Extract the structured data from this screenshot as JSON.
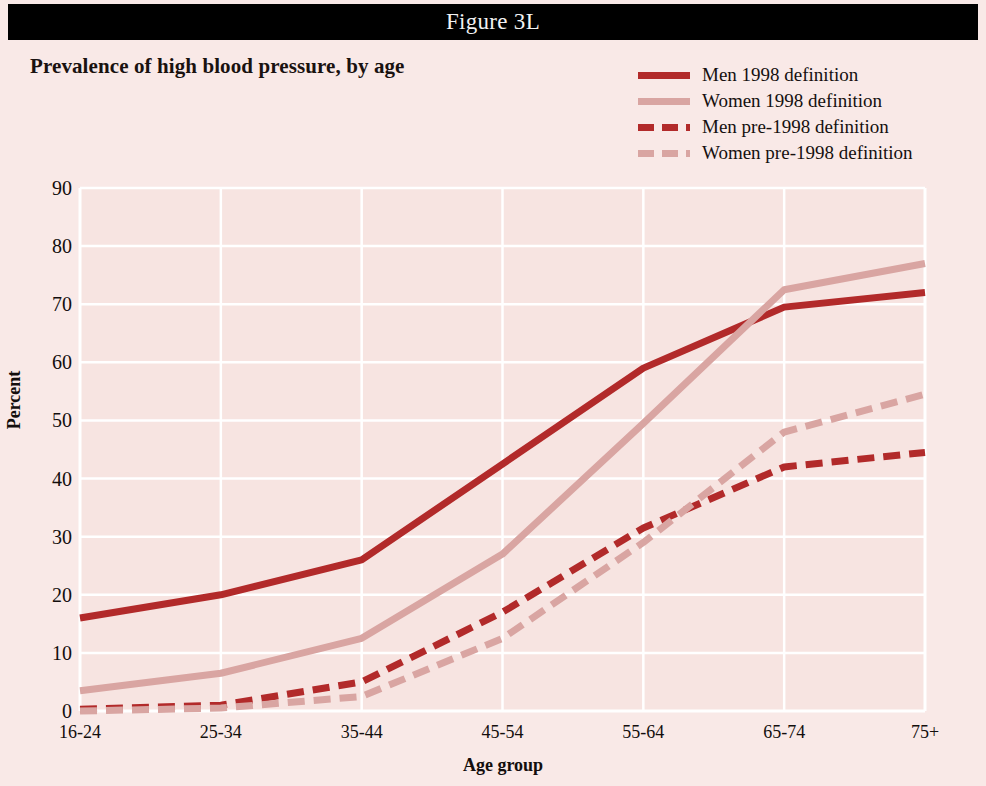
{
  "figure": {
    "label": "Figure 3L"
  },
  "chart_title": "Prevalence of high blood pressure, by age",
  "legend": {
    "items": [
      {
        "label": "Men 1998 definition",
        "color": "#b22a2a",
        "style": "solid"
      },
      {
        "label": "Women 1998 definition",
        "color": "#d9a5a2",
        "style": "solid"
      },
      {
        "label": "Men pre-1998 definition",
        "color": "#b22a2a",
        "style": "dashed"
      },
      {
        "label": "Women pre-1998 definition",
        "color": "#d9a5a2",
        "style": "dashed"
      }
    ]
  },
  "axes": {
    "ylabel": "Percent",
    "xlabel": "Age group",
    "yticks": [
      "0",
      "10",
      "20",
      "30",
      "40",
      "50",
      "60",
      "70",
      "80",
      "90"
    ],
    "xticks": [
      "16-24",
      "25-34",
      "35-44",
      "45-54",
      "55-64",
      "65-74",
      "75+"
    ]
  },
  "colors": {
    "background": "#f9e9e7",
    "plot_background": "#f7e4e1",
    "gridline": "#ffffff",
    "men": "#b22a2a",
    "women": "#d9a5a2",
    "bar_black": "#000000",
    "text": "#130e0d"
  },
  "chart_data": {
    "type": "line",
    "title": "Prevalence of high blood pressure, by age",
    "xlabel": "Age group",
    "ylabel": "Percent",
    "ylim": [
      0,
      90
    ],
    "ytick_step": 10,
    "grid": true,
    "legend_position": "top-right",
    "categories": [
      "16-24",
      "25-34",
      "35-44",
      "45-54",
      "55-64",
      "65-74",
      "75+"
    ],
    "series": [
      {
        "name": "Men 1998 definition",
        "style": "solid",
        "color": "#b22a2a",
        "values": [
          16,
          20,
          26,
          42.5,
          59,
          69.5,
          72
        ]
      },
      {
        "name": "Women 1998 definition",
        "style": "solid",
        "color": "#d9a5a2",
        "values": [
          3.5,
          6.5,
          12.5,
          27,
          49.5,
          72.5,
          77
        ]
      },
      {
        "name": "Men pre-1998 definition",
        "style": "dashed",
        "color": "#b22a2a",
        "values": [
          0.3,
          1,
          5,
          17,
          31.5,
          42,
          44.5
        ]
      },
      {
        "name": "Women pre-1998 definition",
        "style": "dashed",
        "color": "#d9a5a2",
        "values": [
          0,
          0.5,
          2.5,
          12.5,
          29,
          48,
          54.5
        ]
      }
    ]
  }
}
